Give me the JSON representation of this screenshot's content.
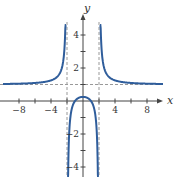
{
  "chart_data": {
    "type": "line",
    "title": "",
    "function": "y = (x^2 - 1)/(x^2 - 4)",
    "xlabel": "x",
    "ylabel": "y",
    "xlim": [
      -10,
      11
    ],
    "ylim": [
      -4.5,
      5
    ],
    "x_ticks": [
      -8,
      -6,
      -4,
      -2,
      2,
      4,
      6,
      8
    ],
    "x_tick_labels": [
      {
        "value": -8,
        "label": "−8"
      },
      {
        "value": -4,
        "label": "−4"
      },
      {
        "value": 4,
        "label": "4"
      },
      {
        "value": 8,
        "label": "8"
      }
    ],
    "y_ticks": [
      -4,
      -3,
      -2,
      -1,
      1,
      2,
      3,
      4
    ],
    "y_tick_labels": [
      {
        "value": 4,
        "label": "4"
      },
      {
        "value": 2,
        "label": "2"
      },
      {
        "value": -2,
        "label": "−2"
      },
      {
        "value": -4,
        "label": "−4"
      }
    ],
    "asymptotes": {
      "vertical": [
        -2,
        2
      ],
      "horizontal": [
        1
      ]
    },
    "key_points": [
      {
        "x": 0,
        "y": 0.25,
        "note": "local max / y-intercept"
      },
      {
        "x": -1,
        "y": 0
      },
      {
        "x": 1,
        "y": 0
      }
    ],
    "series": [
      {
        "name": "left branch",
        "domain": [
          -10,
          -2.13
        ],
        "color": "#2f5d9b"
      },
      {
        "name": "middle branch",
        "domain": [
          -1.915,
          1.915
        ],
        "color": "#2f5d9b"
      },
      {
        "name": "right branch",
        "domain": [
          2.13,
          10
        ],
        "color": "#2f5d9b"
      }
    ],
    "grid": false,
    "legend": "none"
  }
}
